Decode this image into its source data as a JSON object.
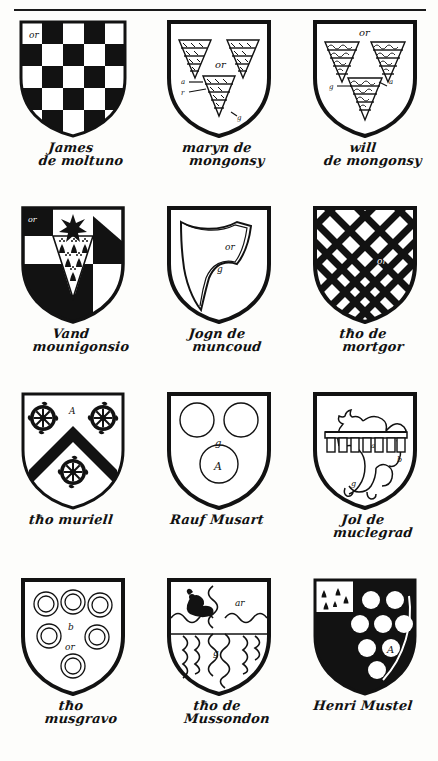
{
  "page": {
    "rule_color": "#1a1a1a",
    "ink_color": "#111111",
    "paper_color": "#fdfdfb",
    "columns": 3,
    "rows": 4
  },
  "shields": [
    {
      "index": 1,
      "blazon_type": "checky",
      "tincture_notes": [
        "or"
      ],
      "field_label": "or",
      "caption_line1": "James",
      "caption_line2": "de moltuno",
      "charges": "checkerboard of 5 rows",
      "colors": {
        "dark": "#121212",
        "light": "#ffffff"
      }
    },
    {
      "index": 2,
      "blazon_type": "three-piles-vair",
      "tincture_notes": [
        "or",
        "a",
        "r",
        "g"
      ],
      "field_label": "or",
      "caption_line1": "maryn de",
      "caption_line2": "mongonsy",
      "charges": "three chevronel-wedges diapered",
      "colors": {
        "dark": "#121212",
        "light": "#ffffff"
      }
    },
    {
      "index": 3,
      "blazon_type": "three-piles-nebuly",
      "tincture_notes": [
        "or",
        "g",
        "a"
      ],
      "field_label": "or",
      "caption_line1": "will",
      "caption_line2": "de mongonsy",
      "charges": "three wedges barry-wavy",
      "colors": {
        "dark": "#121212",
        "light": "#ffffff"
      }
    },
    {
      "index": 4,
      "blazon_type": "quarterly-mullet-chevron-ermine",
      "tincture_notes": [
        "or"
      ],
      "field_label": "or",
      "caption_line1": "Vand",
      "caption_line2": "mounigonsio",
      "charges": "estoile of seven points; chevron ermine",
      "colors": {
        "dark": "#121212",
        "light": "#ffffff"
      }
    },
    {
      "index": 5,
      "blazon_type": "maunch",
      "tincture_notes": [
        "or",
        "g"
      ],
      "field_label": "or",
      "caption_line1": "Jogn de",
      "caption_line2": "muncoud",
      "charges": "a maunch",
      "colors": {
        "dark": "#121212",
        "light": "#ffffff"
      }
    },
    {
      "index": 6,
      "blazon_type": "fretty",
      "tincture_notes": [
        "or"
      ],
      "field_label": "or",
      "caption_line1": "tħo de",
      "caption_line2": "mortgor",
      "charges": "fretty lattice",
      "colors": {
        "dark": "#121212",
        "light": "#ffffff"
      }
    },
    {
      "index": 7,
      "blazon_type": "chevron-three-wheels",
      "tincture_notes": [
        "A"
      ],
      "field_label": "A",
      "caption_line1": "tħo muriell",
      "caption_line2": "",
      "charges": "chevron sable between three Catherine wheels",
      "colors": {
        "dark": "#121212",
        "light": "#ffffff"
      }
    },
    {
      "index": 8,
      "blazon_type": "three-roundels",
      "tincture_notes": [
        "g",
        "A"
      ],
      "field_label": "g",
      "caption_line1": "Rauf Musart",
      "caption_line2": "",
      "charges": "three roundels",
      "colors": {
        "dark": "#121212",
        "light": "#ffffff"
      }
    },
    {
      "index": 9,
      "blazon_type": "lion-rampant-with-label",
      "tincture_notes": [
        "a",
        "b",
        "g"
      ],
      "field_label": "a",
      "caption_line1": "Jol de",
      "caption_line2": "muclegrad",
      "charges": "lion rampant debruised by a label",
      "colors": {
        "dark": "#121212",
        "light": "#ffffff"
      }
    },
    {
      "index": 10,
      "blazon_type": "six-annulets",
      "tincture_notes": [
        "b",
        "or"
      ],
      "field_label": "b",
      "caption_line1": "tħo",
      "caption_line2": "musgravo",
      "charges": "six annulets",
      "colors": {
        "dark": "#121212",
        "light": "#ffffff"
      }
    },
    {
      "index": 11,
      "blazon_type": "quarterly-nebuly-bird",
      "tincture_notes": [
        "ar",
        "g"
      ],
      "field_label": "ar",
      "caption_line1": "tħo de",
      "caption_line2": "Mussondon",
      "charges": "quarterly nebuly, a bird in dexter chief",
      "colors": {
        "dark": "#121212",
        "light": "#ffffff"
      }
    },
    {
      "index": 12,
      "blazon_type": "sable-roundels-ermine-canton",
      "tincture_notes": [
        "A"
      ],
      "field_label": "A",
      "caption_line1": "Henri Mustel",
      "caption_line2": "",
      "charges": "sable, nine plates, a canton ermine",
      "colors": {
        "dark": "#121212",
        "light": "#ffffff"
      }
    }
  ]
}
